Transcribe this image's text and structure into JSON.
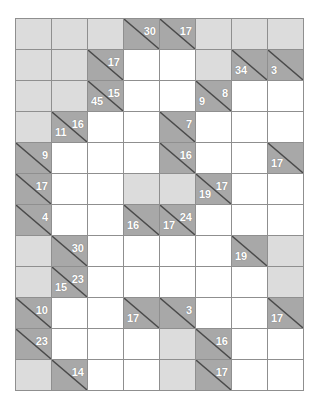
{
  "puzzle": {
    "type": "kakuro",
    "columns": 8,
    "rows": 12,
    "colors": {
      "white_cell": "#ffffff",
      "light_block": "#dcdcdc",
      "clue_block": "#a8a8a8",
      "grid_line": "#8f8f8f",
      "clue_text": "#ffffff"
    },
    "cells": [
      [
        {
          "kind": "light"
        },
        {
          "kind": "light"
        },
        {
          "kind": "light"
        },
        {
          "kind": "clue",
          "right": "30"
        },
        {
          "kind": "clue",
          "right": "17"
        },
        {
          "kind": "light"
        },
        {
          "kind": "light"
        },
        {
          "kind": "light"
        }
      ],
      [
        {
          "kind": "light"
        },
        {
          "kind": "light"
        },
        {
          "kind": "clue",
          "right": "17"
        },
        {
          "kind": "white"
        },
        {
          "kind": "white"
        },
        {
          "kind": "light"
        },
        {
          "kind": "clue",
          "down": "34"
        },
        {
          "kind": "clue",
          "down": "3"
        }
      ],
      [
        {
          "kind": "light"
        },
        {
          "kind": "light"
        },
        {
          "kind": "clue",
          "down": "45",
          "right": "15"
        },
        {
          "kind": "white"
        },
        {
          "kind": "white"
        },
        {
          "kind": "clue",
          "down": "9",
          "right": "8"
        },
        {
          "kind": "white"
        },
        {
          "kind": "white"
        }
      ],
      [
        {
          "kind": "light"
        },
        {
          "kind": "clue",
          "down": "11",
          "right": "16"
        },
        {
          "kind": "white"
        },
        {
          "kind": "white"
        },
        {
          "kind": "clue",
          "right": "7"
        },
        {
          "kind": "white"
        },
        {
          "kind": "white"
        },
        {
          "kind": "white"
        }
      ],
      [
        {
          "kind": "clue",
          "right": "9"
        },
        {
          "kind": "white"
        },
        {
          "kind": "white"
        },
        {
          "kind": "white"
        },
        {
          "kind": "clue",
          "right": "16"
        },
        {
          "kind": "white"
        },
        {
          "kind": "white"
        },
        {
          "kind": "clue",
          "down": "17"
        }
      ],
      [
        {
          "kind": "clue",
          "right": "17"
        },
        {
          "kind": "white"
        },
        {
          "kind": "white"
        },
        {
          "kind": "light"
        },
        {
          "kind": "light"
        },
        {
          "kind": "clue",
          "down": "19",
          "right": "17"
        },
        {
          "kind": "white"
        },
        {
          "kind": "white"
        }
      ],
      [
        {
          "kind": "clue",
          "right": "4"
        },
        {
          "kind": "white"
        },
        {
          "kind": "white"
        },
        {
          "kind": "clue",
          "down": "16"
        },
        {
          "kind": "clue",
          "down": "17",
          "right": "24"
        },
        {
          "kind": "white"
        },
        {
          "kind": "white"
        },
        {
          "kind": "white"
        }
      ],
      [
        {
          "kind": "light"
        },
        {
          "kind": "clue",
          "right": "30"
        },
        {
          "kind": "white"
        },
        {
          "kind": "white"
        },
        {
          "kind": "white"
        },
        {
          "kind": "white"
        },
        {
          "kind": "clue",
          "down": "19"
        },
        {
          "kind": "light"
        }
      ],
      [
        {
          "kind": "light"
        },
        {
          "kind": "clue",
          "down": "15",
          "right": "23"
        },
        {
          "kind": "white"
        },
        {
          "kind": "white"
        },
        {
          "kind": "white"
        },
        {
          "kind": "white"
        },
        {
          "kind": "white"
        },
        {
          "kind": "light"
        }
      ],
      [
        {
          "kind": "clue",
          "right": "10"
        },
        {
          "kind": "white"
        },
        {
          "kind": "white"
        },
        {
          "kind": "clue",
          "down": "17"
        },
        {
          "kind": "clue",
          "right": "3"
        },
        {
          "kind": "white"
        },
        {
          "kind": "white"
        },
        {
          "kind": "clue",
          "down": "17"
        }
      ],
      [
        {
          "kind": "clue",
          "right": "23"
        },
        {
          "kind": "white"
        },
        {
          "kind": "white"
        },
        {
          "kind": "white"
        },
        {
          "kind": "light"
        },
        {
          "kind": "clue",
          "right": "16"
        },
        {
          "kind": "white"
        },
        {
          "kind": "white"
        }
      ],
      [
        {
          "kind": "light"
        },
        {
          "kind": "clue",
          "right": "14"
        },
        {
          "kind": "white"
        },
        {
          "kind": "white"
        },
        {
          "kind": "light"
        },
        {
          "kind": "clue",
          "right": "17"
        },
        {
          "kind": "white"
        },
        {
          "kind": "white"
        }
      ]
    ]
  }
}
